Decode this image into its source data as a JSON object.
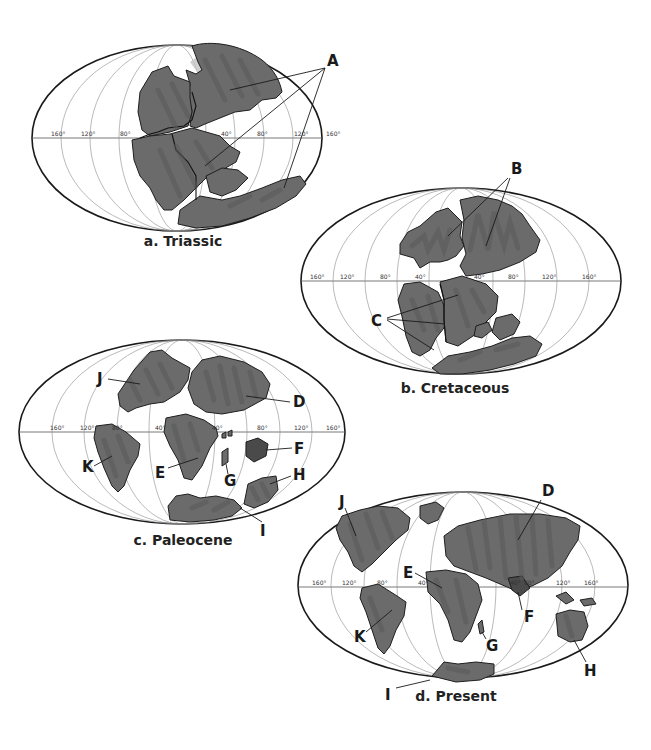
{
  "figure": {
    "maps": [
      {
        "id": "a",
        "caption": "a. Triassic",
        "lon_labels": [
          "160°",
          "120°",
          "80°",
          "40°",
          "80°",
          "120°",
          "160°"
        ],
        "letters": [
          "A"
        ]
      },
      {
        "id": "b",
        "caption": "b. Cretaceous",
        "lon_labels": [
          "160°",
          "120°",
          "80°",
          "40°",
          "40°",
          "80°",
          "120°",
          "160°"
        ],
        "letters": [
          "B",
          "C"
        ]
      },
      {
        "id": "c",
        "caption": "c. Paleocene",
        "lon_labels": [
          "160°",
          "120°",
          "80°",
          "40°",
          "40°",
          "80°",
          "120°",
          "160°"
        ],
        "letters": [
          "J",
          "D",
          "K",
          "E",
          "F",
          "G",
          "H",
          "I"
        ]
      },
      {
        "id": "d",
        "caption": "d. Present",
        "lon_labels": [
          "160°",
          "120°",
          "80°",
          "40°",
          "40°",
          "80°",
          "120°",
          "160°"
        ],
        "letters": [
          "J",
          "D",
          "E",
          "K",
          "F",
          "G",
          "H",
          "I"
        ]
      }
    ]
  },
  "colors": {
    "land": "#6b6b6b",
    "land_dark": "#4a4a4a",
    "outline": "#1a1a1a",
    "graticule": "#8c8c8c",
    "background": "#ffffff"
  }
}
